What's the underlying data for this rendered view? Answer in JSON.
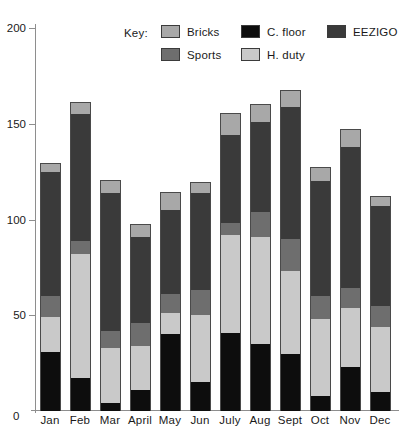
{
  "legend": {
    "title": "Key:",
    "columns": [
      [
        {
          "label": "Bricks",
          "color": "#a8a8a8"
        },
        {
          "label": "Sports",
          "color": "#6e6e6e"
        }
      ],
      [
        {
          "label": "C. floor",
          "color": "#0d0d0d"
        },
        {
          "label": "H. duty",
          "color": "#c9c9c9"
        }
      ],
      [
        {
          "label": "EEZIGO",
          "color": "#3a3a3a"
        }
      ]
    ]
  },
  "axes": {
    "y_ticks": [
      "0",
      "50",
      "100",
      "150",
      "200"
    ],
    "y_min": 0,
    "y_max": 200,
    "zero_label": "0"
  },
  "chart_data": {
    "type": "bar",
    "title": "",
    "xlabel": "",
    "ylabel": "",
    "stacked": true,
    "ylim": [
      0,
      200
    ],
    "grid": false,
    "legend_position": "top",
    "categories": [
      "Jan",
      "Feb",
      "Mar",
      "April",
      "May",
      "Jun",
      "July",
      "Aug",
      "Sept",
      "Oct",
      "Nov",
      "Dec"
    ],
    "series": [
      {
        "name": "C. floor",
        "color": "#0d0d0d",
        "values": [
          31,
          17,
          4,
          11,
          40,
          15,
          41,
          35,
          30,
          8,
          23,
          10
        ]
      },
      {
        "name": "H. duty",
        "color": "#c9c9c9",
        "values": [
          18,
          65,
          29,
          23,
          11,
          35,
          51,
          56,
          43,
          40,
          31,
          34
        ]
      },
      {
        "name": "Sports",
        "color": "#6e6e6e",
        "values": [
          11,
          7,
          9,
          12,
          10,
          13,
          6,
          13,
          17,
          12,
          10,
          11
        ]
      },
      {
        "name": "EEZIGO",
        "color": "#3a3a3a",
        "values": [
          65,
          66,
          72,
          45,
          44,
          51,
          46,
          47,
          69,
          60,
          74,
          52
        ]
      },
      {
        "name": "Bricks",
        "color": "#a8a8a8",
        "values": [
          4,
          6,
          6,
          6,
          9,
          5,
          11,
          9,
          8,
          7,
          9,
          5
        ]
      }
    ],
    "totals": [
      129,
      161,
      120,
      97,
      114,
      119,
      155,
      160,
      167,
      127,
      147,
      112
    ]
  }
}
